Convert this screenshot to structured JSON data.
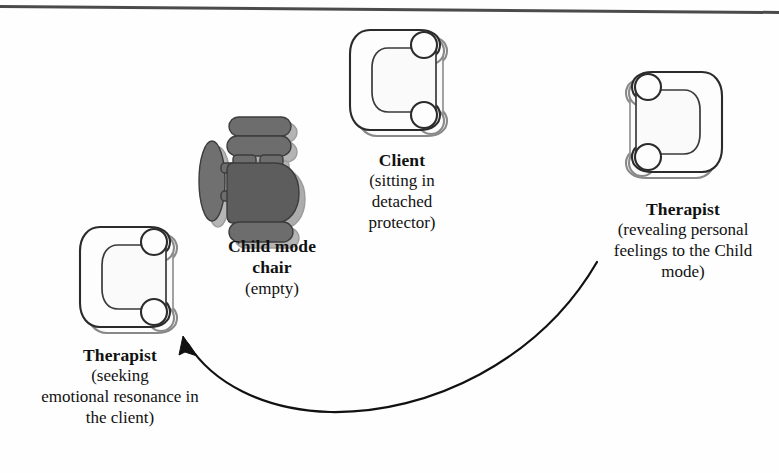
{
  "figure": {
    "type": "seating-arrangement-diagram",
    "background_color": "#fefefe",
    "width": 779,
    "height": 473,
    "scan_edge_line_color": "#2b2b2b"
  },
  "labels": {
    "client": {
      "title": "Client",
      "sub_lines": [
        "(sitting in",
        "detached",
        "protector)"
      ]
    },
    "child_mode": {
      "title_lines": [
        "Child mode",
        "chair"
      ],
      "sub_lines": [
        "(empty)"
      ]
    },
    "therapist_right": {
      "title": "Therapist",
      "sub_lines": [
        "(revealing personal",
        "feelings to the Child",
        "mode)"
      ]
    },
    "therapist_left": {
      "title": "Therapist",
      "sub_lines": [
        "(seeking",
        "emotional resonance in",
        "the client)"
      ]
    }
  },
  "chairs": [
    {
      "id": "client-chair",
      "name": "client-chair",
      "facing": "right",
      "fill": "#fdfdfd",
      "outline": "#2f2f2f",
      "shadow": "#9a9a9a",
      "x": 348,
      "y": 26,
      "w": 100,
      "h": 108
    },
    {
      "id": "child-mode-chair",
      "name": "child-mode-chair",
      "facing": "right",
      "fill": "#6b6b6b",
      "body_fill": "#5a5a5a",
      "outline": "#3a3a3a",
      "shadow": "#8e8e8e",
      "x": 203,
      "y": 117,
      "w": 98,
      "h": 114,
      "state": "empty"
    },
    {
      "id": "therapist-right-chair",
      "name": "therapist-right-chair",
      "facing": "left",
      "fill": "#fdfdfd",
      "outline": "#2f2f2f",
      "shadow": "#9a9a9a",
      "x": 612,
      "y": 68,
      "w": 106,
      "h": 118
    },
    {
      "id": "therapist-left-chair",
      "name": "therapist-left-chair",
      "facing": "right",
      "fill": "#fdfdfd",
      "outline": "#2f2f2f",
      "shadow": "#9a9a9a",
      "x": 78,
      "y": 223,
      "w": 96,
      "h": 108
    }
  ],
  "arrow": {
    "name": "movement-arrow",
    "description": "curved arrow from therapist-right position to therapist-left position",
    "color": "#111111",
    "stroke_width": 2.2,
    "from_x": 597,
    "from_y": 262,
    "to_x": 184,
    "to_y": 339,
    "head": "open-triangle"
  }
}
